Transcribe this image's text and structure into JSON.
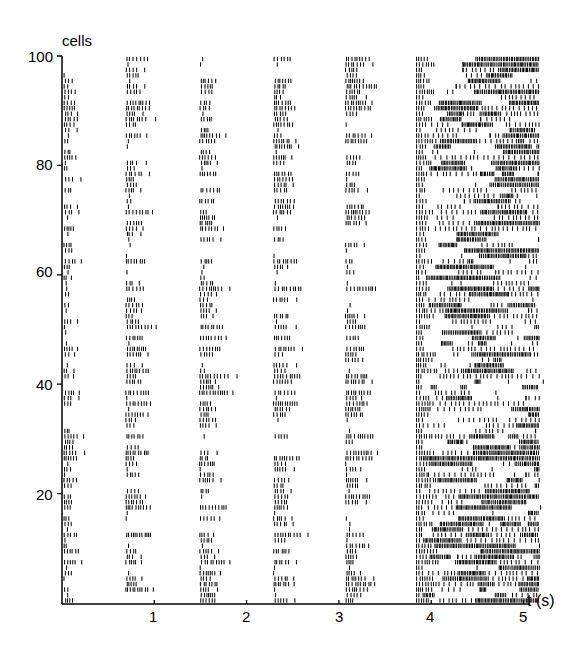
{
  "chart_data": {
    "type": "raster",
    "title": "",
    "ylabel": "cells",
    "xlabel": "t (s)",
    "x_ticks": [
      1,
      2,
      3,
      4,
      5
    ],
    "y_ticks": [
      20,
      40,
      60,
      80,
      100
    ],
    "y_top_label": "100",
    "xlim": [
      0,
      5.2
    ],
    "ylim": [
      0,
      100
    ],
    "n_cells": 100,
    "burst_onsets_s": [
      0.0,
      0.67,
      1.47,
      2.27,
      3.05
    ],
    "burst_duration_s": 0.28,
    "sustained_phase_s": [
      3.82,
      5.15
    ],
    "color": "#000000"
  },
  "labels": {
    "ylabel": "cells",
    "xlabel": "t (s)",
    "y100": "100",
    "y80": "80",
    "y60": "60",
    "y40": "40",
    "y20": "20",
    "x1": "1",
    "x2": "2",
    "x3": "3",
    "x4": "4",
    "x5": "5"
  }
}
